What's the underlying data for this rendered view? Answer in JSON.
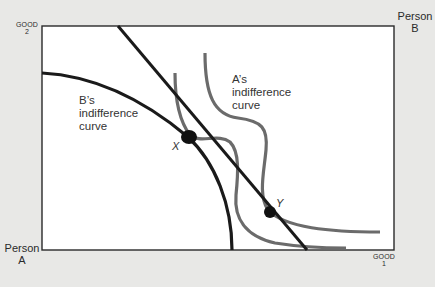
{
  "diagram": {
    "type": "edgeworth-box-indifference",
    "axes": {
      "y_label_line1": "GOOD",
      "y_label_line2": "2",
      "x_label_line1": "GOOD",
      "x_label_line2": "1"
    },
    "origins": {
      "person_a_line1": "Person",
      "person_a_line2": "A",
      "person_b_line1": "Person",
      "person_b_line2": "B"
    },
    "labels": {
      "b_curve_line1": "B’s",
      "b_curve_line2": "indifference",
      "b_curve_line3": "curve",
      "a_curve_line1": "A’s",
      "a_curve_line2": "indifference",
      "a_curve_line3": "curve",
      "point_x": "X",
      "point_y": "Y"
    },
    "colors": {
      "background": "#e8e8e6",
      "plot_bg": "#ffffff",
      "black_curves": "#1a1a1a",
      "gray_curves": "#6b6b6b"
    },
    "elements": [
      {
        "name": "price-line",
        "kind": "straight line",
        "from": [
          118,
          26
        ],
        "to": [
          307,
          250
        ],
        "color": "black"
      },
      {
        "name": "b-indifference-curve",
        "kind": "curve",
        "color": "black",
        "through": "X"
      },
      {
        "name": "a-indifference-curve-inner",
        "kind": "curve",
        "color": "gray",
        "through": "X"
      },
      {
        "name": "a-indifference-curve-outer",
        "kind": "curve",
        "color": "gray",
        "through": "Y"
      },
      {
        "name": "point-x",
        "kind": "point",
        "at": [
          188,
          137
        ]
      },
      {
        "name": "point-y",
        "kind": "point",
        "at": [
          270,
          212
        ]
      }
    ]
  }
}
